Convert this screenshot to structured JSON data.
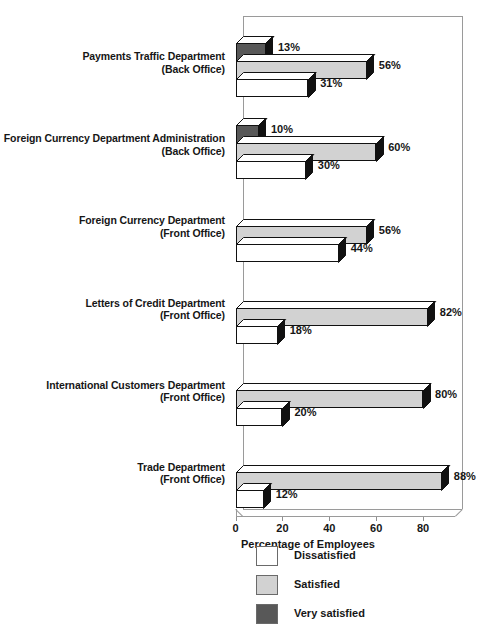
{
  "chart_data": {
    "type": "bar",
    "orientation": "horizontal",
    "title": "",
    "xlabel": "Percentage of Employees",
    "ylabel": "",
    "xlim": [
      0,
      100
    ],
    "xticks": [
      0,
      20,
      40,
      60,
      80
    ],
    "xtick_labels": [
      "0",
      "20",
      "40",
      "60",
      "80"
    ],
    "grid": false,
    "legend_position": "bottom",
    "value_suffix": "%",
    "categories": [
      {
        "line1": "Payments Traffic Department",
        "line2": "(Back Office)"
      },
      {
        "line1": "Foreign Currency Department Administration",
        "line2": "(Back Office)"
      },
      {
        "line1": "Foreign Currency Department",
        "line2": "(Front Office)"
      },
      {
        "line1": "Letters of Credit Department",
        "line2": "(Front Office)"
      },
      {
        "line1": "International Customers Department",
        "line2": "(Front Office)"
      },
      {
        "line1": "Trade Department",
        "line2": "(Front Office)"
      }
    ],
    "series": [
      {
        "name": "Dissatisfied",
        "key": "dissatisfied",
        "color": "#ffffff",
        "values": [
          31,
          30,
          44,
          18,
          20,
          12
        ],
        "labels": [
          "31%",
          "30%",
          "44%",
          "18%",
          "20%",
          "12%"
        ]
      },
      {
        "name": "Satisfied",
        "key": "satisfied",
        "color": "#d2d2d2",
        "values": [
          56,
          60,
          56,
          82,
          80,
          88
        ],
        "labels": [
          "56%",
          "60%",
          "56%",
          "82%",
          "80%",
          "88%"
        ]
      },
      {
        "name": "Very satisfied",
        "key": "very_satisfied",
        "color": "#585858",
        "values": [
          13,
          10,
          0,
          0,
          0,
          0
        ],
        "labels": [
          "13%",
          "10%",
          "",
          "",
          "",
          ""
        ]
      }
    ]
  },
  "legend": {
    "items": [
      {
        "label": "Dissatisfied",
        "color": "#ffffff"
      },
      {
        "label": "Satisfied",
        "color": "#d2d2d2"
      },
      {
        "label": "Very satisfied",
        "color": "#585858"
      }
    ]
  }
}
